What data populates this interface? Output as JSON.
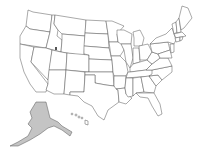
{
  "map": {
    "title": "United States",
    "type": "choropleth-highlight",
    "highlighted_states": [
      "Alaska"
    ],
    "colors": {
      "default_fill": "#ffffff",
      "highlight_fill": "#c4c4c4",
      "border": "#555555",
      "background": "#ffffff"
    }
  }
}
